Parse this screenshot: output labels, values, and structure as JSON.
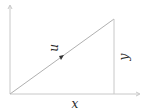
{
  "diagram": {
    "type": "vector-components",
    "vector_label": "u",
    "horizontal_component_label": "x",
    "vertical_component_label": "y",
    "colors": {
      "axis": "#c8c8c8",
      "vector": "#b0b0b0",
      "label": "#2a2a2a",
      "arrowhead": "#333333"
    }
  }
}
